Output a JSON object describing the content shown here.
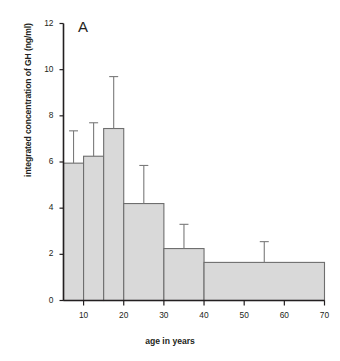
{
  "figure": {
    "panel_label": "A",
    "artifact_text": ""
  },
  "chart_data": {
    "type": "bar",
    "title": "",
    "panel": "A",
    "xlabel": "age in years",
    "ylabel": "integrated concentration of GH (ng/ml)",
    "xlim": [
      5,
      70
    ],
    "ylim": [
      0,
      12
    ],
    "xticks": [
      10,
      20,
      30,
      40,
      50,
      60,
      70
    ],
    "yticks": [
      0,
      2,
      4,
      6,
      8,
      10,
      12
    ],
    "xtick_labels": [
      "10",
      "20",
      "30",
      "40",
      "50",
      "60",
      "70"
    ],
    "ytick_labels": [
      "0",
      "2",
      "4",
      "6",
      "8",
      "10",
      "12"
    ],
    "grid": false,
    "legend": null,
    "bar_color": "#d9d9d9",
    "bar_edge_color": "#6e6e6e",
    "error_bar_color": "#7a7a7a",
    "axis_color": "#231f20",
    "bins": [
      {
        "x_start": 5,
        "x_end": 10,
        "value": 5.95,
        "error_upper": 7.35
      },
      {
        "x_start": 10,
        "x_end": 15,
        "value": 6.25,
        "error_upper": 7.7
      },
      {
        "x_start": 15,
        "x_end": 20,
        "value": 7.45,
        "error_upper": 9.7
      },
      {
        "x_start": 20,
        "x_end": 30,
        "value": 4.2,
        "error_upper": 5.85
      },
      {
        "x_start": 30,
        "x_end": 40,
        "value": 2.25,
        "error_upper": 3.3
      },
      {
        "x_start": 40,
        "x_end": 70,
        "value": 1.65,
        "error_upper": 2.55
      }
    ],
    "categories": [
      "5-10",
      "10-15",
      "15-20",
      "20-30",
      "30-40",
      "40-70"
    ],
    "values": [
      5.95,
      6.25,
      7.45,
      4.2,
      2.25,
      1.65
    ],
    "error_upper": [
      7.35,
      7.7,
      9.7,
      5.85,
      3.3,
      2.55
    ]
  }
}
